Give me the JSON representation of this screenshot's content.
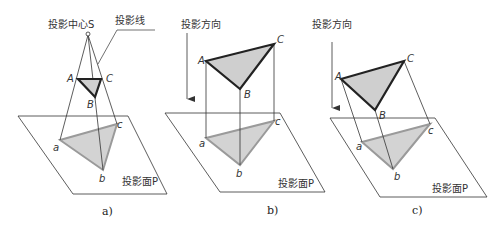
{
  "colors": {
    "line": "#333333",
    "edge_thick": "#222222",
    "triangle_fill": "#cfcfcf",
    "projection_edge": "#9a9a9a",
    "projection_fill": "#d3d3d3"
  },
  "panels": [
    {
      "id": "a",
      "caption": "a)",
      "type": "central-projection",
      "center_label": "投影中心S",
      "projection_line_label": "投影线",
      "plane_label": "投影面P",
      "points_upper": {
        "A": "A",
        "B": "B",
        "C": "C"
      },
      "points_lower": {
        "a": "a",
        "b": "b",
        "c": "c"
      }
    },
    {
      "id": "b",
      "caption": "b)",
      "type": "orthographic-parallel-projection",
      "direction_label": "投影方向",
      "plane_label": "投影面P",
      "points_upper": {
        "A": "A",
        "B": "B",
        "C": "C"
      },
      "points_lower": {
        "a": "a",
        "b": "b",
        "c": "c"
      }
    },
    {
      "id": "c",
      "caption": "c)",
      "type": "oblique-parallel-projection",
      "direction_label": "投影方向",
      "plane_label": "投影面P",
      "points_upper": {
        "A": "A",
        "B": "B",
        "C": "C"
      },
      "points_lower": {
        "a": "a",
        "b": "b",
        "c": "c"
      }
    }
  ]
}
